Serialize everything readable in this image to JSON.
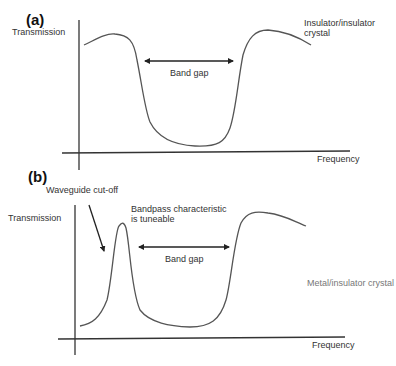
{
  "panel_a": {
    "label": "(a)",
    "y_axis_label": "Transmission",
    "x_axis_label": "Frequency",
    "band_gap_label": "Band gap",
    "crystal_label_line1": "Insulator/insulator",
    "crystal_label_line2": "crystal"
  },
  "panel_b": {
    "label": "(b)",
    "y_axis_label": "Transmission",
    "x_axis_label": "Frequency",
    "band_gap_label": "Band gap",
    "cutoff_label": "Waveguide cut-off",
    "bandpass_label_line1": "Bandpass characteristic",
    "bandpass_label_line2": "is tuneable",
    "crystal_label": "Metal/insulator crystal"
  },
  "colors": {
    "axis": "#333333",
    "curve": "#555555",
    "text": "#333333",
    "muted_text": "#777777"
  }
}
